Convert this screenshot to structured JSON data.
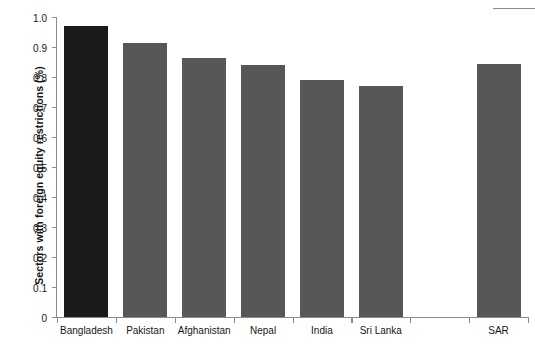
{
  "chart_data": {
    "type": "bar",
    "title": "",
    "xlabel": "",
    "ylabel": "Sectors with foreign equity restrictions (%)",
    "categories": [
      "Bangladesh",
      "Pakistan",
      "Afghanistan",
      "Nepal",
      "India",
      "Sri Lanka",
      "",
      "SAR"
    ],
    "values": [
      0.97,
      0.915,
      0.865,
      0.84,
      0.79,
      0.77,
      null,
      0.845
    ],
    "ylim": [
      0,
      1.0
    ],
    "ytick_labels": [
      "1.0",
      "0.9",
      "0.8",
      "0.7",
      "0.6",
      "0.5",
      "0.4",
      "0.3",
      "0.2",
      "0.1",
      "0"
    ],
    "ytick_values": [
      1.0,
      0.9,
      0.8,
      0.7,
      0.6,
      0.5,
      0.4,
      0.3,
      0.2,
      0.1,
      0
    ],
    "grid": false,
    "legend": null,
    "colors": {
      "bar_default": "#575757",
      "bar_highlight": "#1a1a1a",
      "axis": "#8b8b8b",
      "text": "#161616",
      "background": "#ffffff"
    },
    "highlight_category": "Bangladesh"
  }
}
